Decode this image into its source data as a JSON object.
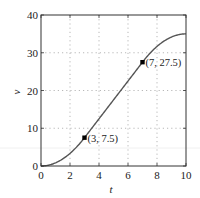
{
  "chart_data": {
    "type": "line",
    "title": "",
    "xlabel": "t",
    "ylabel": "v",
    "xlim": [
      0,
      10
    ],
    "ylim": [
      0,
      40
    ],
    "xticks": [
      0,
      2,
      4,
      6,
      8,
      10
    ],
    "yticks": [
      0,
      10,
      20,
      30,
      40
    ],
    "grid": true,
    "grid_style": "dotted",
    "legend": null,
    "series": [
      {
        "name": "v(t)",
        "color": "#555555",
        "x": [
          0,
          0.5,
          1,
          1.5,
          2,
          2.5,
          3,
          4,
          5,
          6,
          7,
          7.5,
          8,
          8.5,
          9,
          9.5,
          10
        ],
        "y": [
          0,
          0.21,
          0.83,
          1.88,
          3.33,
          5.21,
          7.5,
          12.5,
          17.5,
          22.5,
          27.5,
          29.79,
          31.67,
          33.13,
          34.17,
          34.79,
          35
        ]
      }
    ],
    "annotations": [
      {
        "x": 3,
        "y": 7.5,
        "label": "(3, 7.5)",
        "marker": "square"
      },
      {
        "x": 7,
        "y": 27.5,
        "label": "(7, 27.5)",
        "marker": "square"
      }
    ]
  }
}
